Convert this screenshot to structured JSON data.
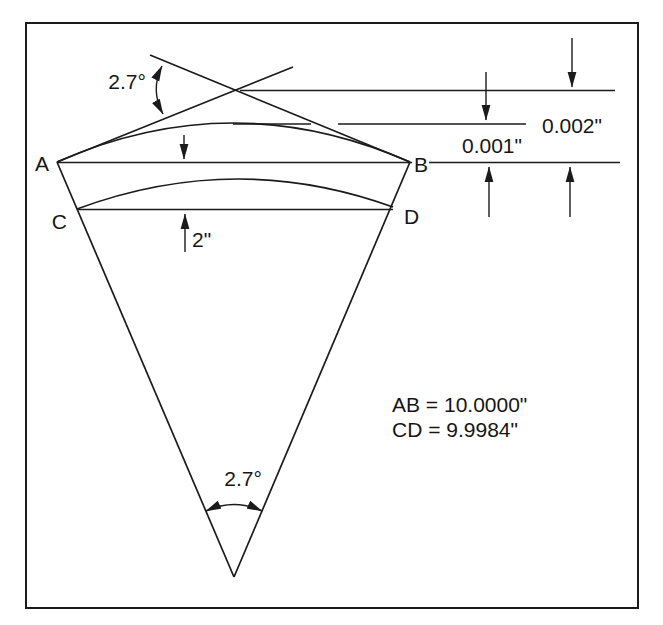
{
  "figure": {
    "points": {
      "a": "A",
      "b": "B",
      "c": "C",
      "d": "D"
    },
    "angle_top": "2.7°",
    "angle_bottom": "2.7°",
    "dim_top_offset": "0.002\"",
    "dim_mid_offset": "0.001\"",
    "dim_chord_gap": "2\"",
    "eq_ab": "AB = 10.0000\"",
    "eq_cd": "CD = 9.9984\"",
    "colors": {
      "ink": "#1b1b1b",
      "paper": "#ffffff"
    }
  }
}
